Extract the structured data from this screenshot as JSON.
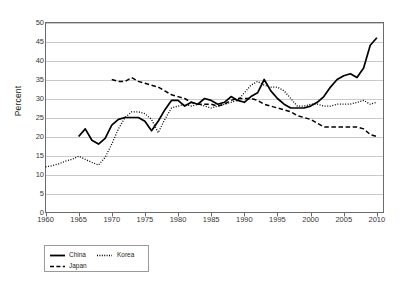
{
  "chart_data": {
    "type": "line",
    "title": "",
    "xlabel": "",
    "ylabel": "Percent",
    "xlim": [
      1960,
      2011
    ],
    "ylim": [
      0,
      50
    ],
    "grid": true,
    "legend_position": "bottom-left",
    "y_ticks": [
      0,
      5,
      10,
      15,
      20,
      25,
      30,
      35,
      40,
      45,
      50
    ],
    "x_ticks": [
      1960,
      1965,
      1970,
      1975,
      1980,
      1985,
      1990,
      1995,
      2000,
      2005,
      2010
    ],
    "series": [
      {
        "name": "China",
        "style": "solid",
        "color": "#000000",
        "x": [
          1965,
          1966,
          1967,
          1968,
          1969,
          1970,
          1971,
          1972,
          1973,
          1974,
          1975,
          1976,
          1977,
          1978,
          1979,
          1980,
          1981,
          1982,
          1983,
          1984,
          1985,
          1986,
          1987,
          1988,
          1989,
          1990,
          1991,
          1992,
          1993,
          1994,
          1995,
          1996,
          1997,
          1998,
          1999,
          2000,
          2001,
          2002,
          2003,
          2004,
          2005,
          2006,
          2007,
          2008,
          2009,
          2010
        ],
        "values": [
          20.0,
          22.0,
          19.0,
          18.0,
          19.5,
          23.0,
          24.5,
          25.0,
          25.0,
          25.0,
          24.0,
          21.5,
          24.0,
          27.0,
          29.5,
          29.5,
          28.0,
          29.0,
          28.5,
          30.0,
          29.5,
          28.5,
          29.0,
          30.5,
          29.5,
          29.0,
          30.5,
          31.5,
          35.0,
          32.0,
          30.0,
          28.5,
          27.5,
          27.5,
          27.5,
          28.0,
          29.0,
          30.5,
          33.0,
          35.0,
          36.0,
          36.5,
          35.5,
          38.0,
          44.0,
          46.0
        ]
      },
      {
        "name": "Korea",
        "style": "dotted",
        "color": "#000000",
        "x": [
          1960,
          1961,
          1962,
          1963,
          1964,
          1965,
          1966,
          1967,
          1968,
          1969,
          1970,
          1971,
          1972,
          1973,
          1974,
          1975,
          1976,
          1977,
          1978,
          1979,
          1980,
          1981,
          1982,
          1983,
          1984,
          1985,
          1986,
          1987,
          1988,
          1989,
          1990,
          1991,
          1992,
          1993,
          1994,
          1995,
          1996,
          1997,
          1998,
          1999,
          2000,
          2001,
          2002,
          2003,
          2004,
          2005,
          2006,
          2007,
          2008,
          2009,
          2010
        ],
        "values": [
          12.0,
          12.3,
          12.8,
          13.5,
          14.0,
          14.8,
          14.0,
          13.2,
          12.5,
          14.5,
          18.0,
          22.0,
          25.0,
          26.5,
          26.5,
          26.0,
          24.5,
          21.0,
          24.5,
          27.5,
          28.0,
          28.5,
          28.0,
          28.5,
          28.0,
          27.5,
          28.0,
          28.5,
          29.0,
          29.5,
          31.5,
          33.5,
          34.5,
          33.5,
          33.0,
          33.0,
          32.0,
          30.0,
          28.0,
          28.0,
          28.5,
          28.5,
          28.0,
          28.0,
          28.5,
          28.5,
          28.5,
          29.0,
          29.5,
          28.5,
          29.0
        ]
      },
      {
        "name": "Japan",
        "style": "dashed",
        "color": "#000000",
        "x": [
          1970,
          1971,
          1972,
          1973,
          1974,
          1975,
          1976,
          1977,
          1978,
          1979,
          1980,
          1981,
          1982,
          1983,
          1984,
          1985,
          1986,
          1987,
          1988,
          1989,
          1990,
          1991,
          1992,
          1993,
          1994,
          1995,
          1996,
          1997,
          1998,
          1999,
          2000,
          2001,
          2002,
          2003,
          2004,
          2005,
          2006,
          2007,
          2008,
          2009,
          2010
        ],
        "values": [
          35.0,
          34.5,
          34.5,
          35.5,
          34.5,
          34.0,
          33.5,
          33.0,
          32.0,
          31.0,
          30.5,
          30.0,
          29.0,
          28.5,
          28.5,
          28.5,
          28.0,
          28.5,
          29.5,
          30.0,
          30.0,
          30.0,
          29.5,
          28.5,
          28.0,
          27.5,
          27.0,
          26.5,
          25.5,
          25.0,
          24.5,
          23.5,
          22.5,
          22.5,
          22.5,
          22.5,
          22.5,
          22.5,
          22.0,
          20.5,
          20.0
        ]
      }
    ]
  },
  "axes": {
    "ylabel": "Percent",
    "y_tick_labels": [
      "50",
      "45",
      "40",
      "35",
      "30",
      "25",
      "20",
      "15",
      "10",
      "5",
      "0"
    ],
    "x_tick_labels": [
      "1960",
      "1965",
      "1970",
      "1975",
      "1980",
      "1985",
      "1990",
      "1995",
      "2000",
      "2005",
      "2010"
    ]
  },
  "legend": {
    "items": [
      {
        "label": "China",
        "style": "solid"
      },
      {
        "label": "Korea",
        "style": "dotted"
      },
      {
        "label": "Japan",
        "style": "dashed"
      }
    ]
  },
  "colors": {
    "line": "#000000",
    "grid": "#c9c9c9",
    "frame": "#6b6b6b",
    "text": "#231f20"
  }
}
